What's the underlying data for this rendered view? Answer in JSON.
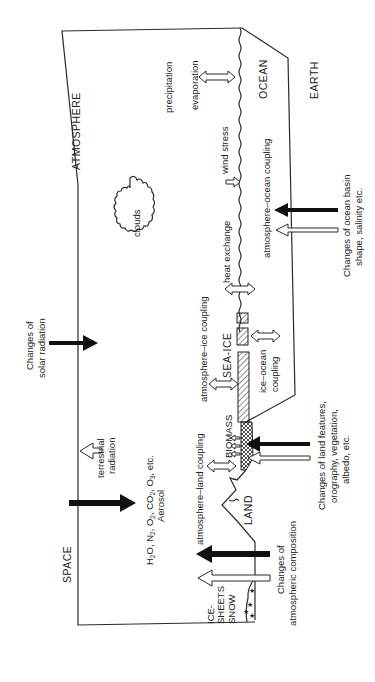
{
  "diagram": {
    "orientation": "rotated 90 degrees counter-clockwise",
    "regions": {
      "space": "SPACE",
      "atmosphere": "ATMOSPHERE",
      "ocean": "OCEAN",
      "earth": "EARTH",
      "land": "LAND",
      "sea_ice": "SEA-ICE",
      "biomass": "BIOMASS",
      "ice_sheets_line1": "ICE-",
      "ice_sheets_line2": "SHEETS",
      "ice_sheets_line3": "SNOW",
      "clouds": "clouds"
    },
    "processes": {
      "precipitation": "precipitation",
      "evaporation": "evaporation",
      "wind_stress": "wind stress",
      "heat_exchange": "heat exchange",
      "atmosphere_ocean_coupling": "atmosphere–ocean coupling",
      "atmosphere_ice_coupling": "atmosphere–ice coupling",
      "atmosphere_land_coupling": "atmosphere–land coupling",
      "ice_ocean_coupling_line1": "ice–ocean",
      "ice_ocean_coupling_line2": "coupling",
      "terrestrial_radiation_line1": "terrestrial",
      "terrestrial_radiation_line2": "radiation"
    },
    "composition": {
      "line1_parts": [
        "H",
        "2",
        "O, N",
        "2",
        ", O",
        "2",
        ", CO",
        "2",
        ", O",
        "3",
        ", etc."
      ],
      "line2": "Aerosol"
    },
    "external_forcings": {
      "solar_line1": "Changes of",
      "solar_line2": "solar radiation",
      "ocean_basin_line1": "Changes of ocean basin",
      "ocean_basin_line2": "shape, salinity etc.",
      "land_line1": "Changes of land features,",
      "land_line2": "orography, vegetation,",
      "land_line3": "albedo, etc.",
      "atmos_comp_line1": "Changes of",
      "atmos_comp_line2": "atmospheric composition"
    },
    "colors": {
      "ink": "#222222",
      "background": "#ffffff"
    }
  }
}
